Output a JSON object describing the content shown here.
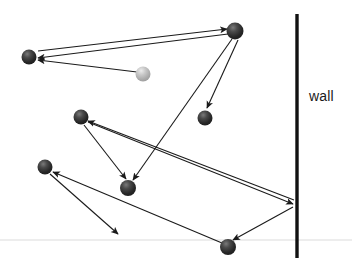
{
  "canvas": {
    "width": 352,
    "height": 263,
    "background": "#ffffff"
  },
  "labels": {
    "wall": "wall"
  },
  "colors": {
    "ink": "#1a1a1a",
    "ball_dark": "#2b2b2b",
    "ball_dark_highlight": "#6e6e6e",
    "ball_light": "#b5b5b5",
    "ball_light_highlight": "#e3e3e3",
    "wall": "#111111",
    "floor": "#ededed",
    "arrow": "#1a1a1a"
  },
  "scene_data": {
    "type": "diagram",
    "description": "Billiard-ball trajectory diagram with arrows between balls and a vertical wall",
    "wall": {
      "x": 297,
      "y1": 14,
      "y2": 258,
      "thickness": 3,
      "label": "wall"
    },
    "floor": {
      "y": 240,
      "x1": 0,
      "x2": 352,
      "thickness": 1
    },
    "balls": [
      {
        "id": "ball-top-left",
        "cx": 29,
        "cy": 57,
        "r": 7.5,
        "shade": "dark"
      },
      {
        "id": "ball-light-mid",
        "cx": 143,
        "cy": 74,
        "r": 7.5,
        "shade": "light"
      },
      {
        "id": "ball-top-right",
        "cx": 235,
        "cy": 31,
        "r": 8.5,
        "shade": "dark"
      },
      {
        "id": "ball-mid-right",
        "cx": 205,
        "cy": 118,
        "r": 7.5,
        "shade": "dark"
      },
      {
        "id": "ball-mid-left",
        "cx": 81,
        "cy": 117,
        "r": 7.5,
        "shade": "dark"
      },
      {
        "id": "ball-lower-left",
        "cx": 45,
        "cy": 167,
        "r": 7.5,
        "shade": "dark"
      },
      {
        "id": "ball-center-low",
        "cx": 128,
        "cy": 188,
        "r": 8.0,
        "shade": "dark"
      },
      {
        "id": "ball-bottom",
        "cx": 228,
        "cy": 247,
        "r": 8.0,
        "shade": "dark"
      }
    ],
    "arrows": [
      {
        "id": "arrow-light-to-topleft",
        "x1": 137,
        "y1": 72,
        "x2": 38,
        "y2": 60,
        "head": "end"
      },
      {
        "id": "arrow-topright-to-topleft",
        "x1": 228,
        "y1": 34,
        "x2": 38,
        "y2": 58,
        "head": "end"
      },
      {
        "id": "arrow-topleft-to-topright",
        "x1": 38,
        "y1": 56,
        "x2": 227,
        "y2": 31,
        "head": "end"
      },
      {
        "id": "arrow-topright-to-midright",
        "x1": 237,
        "y1": 40,
        "x2": 207,
        "y2": 109,
        "head": "end"
      },
      {
        "id": "arrow-midright-to-centerlow",
        "x1": 231,
        "y1": 38,
        "x2": 133,
        "y2": 180,
        "head": "end"
      },
      {
        "id": "arrow-midleft-to-wall",
        "x1": 88,
        "y1": 122,
        "x2": 294,
        "y2": 204,
        "head": "end"
      },
      {
        "id": "arrow-wall-to-midleft",
        "x1": 294,
        "y1": 203,
        "x2": 88,
        "y2": 121,
        "head": "end"
      },
      {
        "id": "arrow-midleft-to-centerlow",
        "x1": 84,
        "y1": 125,
        "x2": 126,
        "y2": 180,
        "head": "end"
      },
      {
        "id": "arrow-bottom-to-lowerleft",
        "x1": 222,
        "y1": 243,
        "x2": 53,
        "y2": 172,
        "head": "end"
      },
      {
        "id": "arrow-lowerleft-down",
        "x1": 50,
        "y1": 174,
        "x2": 118,
        "y2": 234,
        "head": "end"
      },
      {
        "id": "arrow-wall-to-bottom",
        "x1": 293,
        "y1": 207,
        "x2": 233,
        "y2": 240,
        "head": "end"
      }
    ]
  }
}
